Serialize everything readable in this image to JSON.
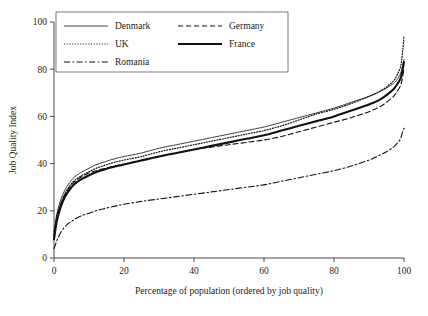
{
  "figure": {
    "background": "#ffffff",
    "ink_color": "#111111",
    "axis_color": "#4a4a4a"
  },
  "axes": {
    "x_title": "Percentage of population (ordered by job quality)",
    "y_title": "Job Quality Index",
    "x_ticks": [
      "0",
      "20",
      "40",
      "60",
      "80",
      "100"
    ],
    "y_ticks": [
      "0",
      "20",
      "40",
      "60",
      "80",
      "100"
    ]
  },
  "legend": {
    "entries": [
      {
        "label": "Denmark",
        "style": "solid-thin"
      },
      {
        "label": "Germany",
        "style": "dashed"
      },
      {
        "label": "UK",
        "style": "dotted"
      },
      {
        "label": "France",
        "style": "solid-thick"
      },
      {
        "label": "Romania",
        "style": "dash-dot"
      }
    ]
  },
  "chart_data": {
    "type": "line",
    "title": "",
    "subtitle": "",
    "xlabel": "Percentage of population (ordered by job quality)",
    "ylabel": "Job Quality Index",
    "xlim": [
      0,
      100
    ],
    "ylim": [
      0,
      100
    ],
    "xticks": [
      0,
      20,
      40,
      60,
      80,
      100
    ],
    "yticks": [
      0,
      20,
      40,
      60,
      80,
      100
    ],
    "grid": false,
    "legend_position": "top-left",
    "x": [
      0,
      0.5,
      1,
      2,
      3,
      4,
      5,
      6,
      8,
      10,
      12,
      14,
      16,
      18,
      20,
      25,
      30,
      35,
      40,
      45,
      50,
      55,
      60,
      65,
      70,
      75,
      80,
      85,
      90,
      93,
      95,
      97,
      98,
      99,
      99.5,
      100
    ],
    "series": [
      {
        "name": "Denmark",
        "style": "solid-thin",
        "values": [
          11,
          16,
          20,
          25,
          28.5,
          31,
          33,
          34.5,
          36.5,
          38,
          39.5,
          40.5,
          41.5,
          42.3,
          43,
          44.5,
          46.5,
          48,
          49.5,
          51,
          52.5,
          54,
          55.5,
          57.5,
          59.5,
          61.5,
          63.5,
          66,
          68.5,
          70.5,
          72,
          74,
          75.5,
          78,
          81,
          84
        ]
      },
      {
        "name": "UK",
        "style": "dotted",
        "values": [
          10,
          15,
          19,
          23.5,
          27,
          29.5,
          31.5,
          33,
          35,
          36.5,
          38,
          39,
          40,
          40.8,
          41.5,
          43,
          45,
          46.5,
          48,
          49.5,
          51,
          52.5,
          54,
          56,
          58.5,
          61,
          63,
          65.5,
          68.5,
          70.5,
          72.5,
          75,
          77.5,
          81,
          86,
          94
        ]
      },
      {
        "name": "Romania",
        "style": "dash-dot",
        "values": [
          4,
          6,
          8,
          11,
          13,
          14.5,
          15.5,
          16.5,
          18,
          19,
          20,
          20.8,
          21.5,
          22.2,
          22.8,
          24,
          25,
          26,
          27,
          28,
          29,
          30,
          31,
          32.5,
          34,
          35.5,
          37,
          39,
          41.5,
          43.5,
          45,
          47,
          48.5,
          50.5,
          53,
          55
        ]
      },
      {
        "name": "Germany",
        "style": "dashed",
        "values": [
          9,
          14,
          18,
          23,
          26.5,
          29,
          31,
          32.5,
          34.5,
          36,
          37,
          37.8,
          38.5,
          39.2,
          39.8,
          41.5,
          43,
          44.5,
          46,
          47,
          48,
          49,
          50,
          51.5,
          53.5,
          55.5,
          57.5,
          59.5,
          62,
          64,
          66,
          68.5,
          70.5,
          73,
          76,
          80
        ]
      },
      {
        "name": "France",
        "style": "solid-thick",
        "values": [
          8,
          13,
          17,
          22,
          25.5,
          28,
          30,
          31.5,
          33.5,
          35,
          36.3,
          37.3,
          38.2,
          39,
          39.6,
          41.3,
          43,
          44.5,
          46,
          47.5,
          49,
          50.5,
          52,
          54,
          56,
          58,
          60,
          62.5,
          65,
          67,
          69,
          71.5,
          73.5,
          76,
          79,
          83
        ]
      }
    ]
  }
}
